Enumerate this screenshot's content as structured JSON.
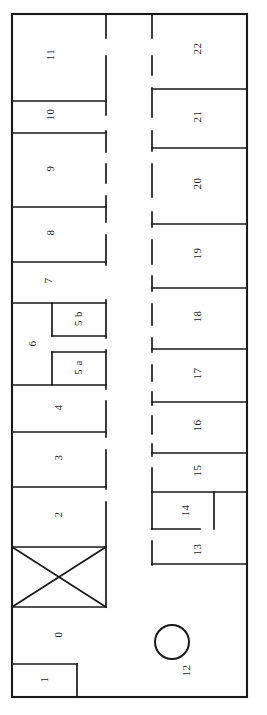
{
  "diagram": {
    "type": "floor-plan",
    "orientation": "rotated-90",
    "stroke_color": "#1a1a1a",
    "background_color": "#ffffff",
    "outline": {
      "x": 11,
      "y": 13,
      "width": 236,
      "height": 684
    },
    "rooms": [
      {
        "id": "room-0",
        "label": "0",
        "x": 12,
        "y": 607,
        "width": 94,
        "height": 57,
        "label_cx": 58,
        "label_cy": 636
      },
      {
        "id": "room-1",
        "label": "1",
        "x": 12,
        "y": 664,
        "width": 65,
        "height": 32,
        "label_cx": 44,
        "label_cy": 681
      },
      {
        "id": "room-2",
        "label": "2",
        "x": 12,
        "y": 487,
        "width": 94,
        "height": 60,
        "label_cx": 58,
        "label_cy": 516
      },
      {
        "id": "room-3",
        "label": "3",
        "x": 12,
        "y": 432,
        "width": 94,
        "height": 55,
        "label_cx": 58,
        "label_cy": 459
      },
      {
        "id": "room-4",
        "label": "4",
        "x": 12,
        "y": 385,
        "width": 94,
        "height": 47,
        "label_cx": 58,
        "label_cy": 409
      },
      {
        "id": "room-5a",
        "label": "5 a",
        "x": 52,
        "y": 352,
        "width": 54,
        "height": 33,
        "label_cx": 78,
        "label_cy": 369
      },
      {
        "id": "room-5b",
        "label": "5 b",
        "x": 52,
        "y": 303,
        "width": 54,
        "height": 33,
        "label_cx": 78,
        "label_cy": 320
      },
      {
        "id": "room-6",
        "label": "6",
        "x": 12,
        "y": 303,
        "width": 94,
        "height": 82,
        "label_cx": 32,
        "label_cy": 345
      },
      {
        "id": "room-7",
        "label": "7",
        "x": 12,
        "y": 262,
        "width": 94,
        "height": 41,
        "label_cx": 48,
        "label_cy": 282
      },
      {
        "id": "room-8",
        "label": "8",
        "x": 12,
        "y": 207,
        "width": 94,
        "height": 55,
        "label_cx": 50,
        "label_cy": 234
      },
      {
        "id": "room-9",
        "label": "9",
        "x": 12,
        "y": 133,
        "width": 94,
        "height": 74,
        "label_cx": 50,
        "label_cy": 170
      },
      {
        "id": "room-10",
        "label": "10",
        "x": 12,
        "y": 101,
        "width": 94,
        "height": 32,
        "label_cx": 50,
        "label_cy": 116
      },
      {
        "id": "room-11",
        "label": "11",
        "x": 12,
        "y": 13,
        "width": 94,
        "height": 88,
        "label_cx": 50,
        "label_cy": 56
      },
      {
        "id": "room-12",
        "label": "12",
        "x": 106,
        "y": 564,
        "width": 141,
        "height": 133,
        "label_cx": 186,
        "label_cy": 672
      },
      {
        "id": "room-13",
        "label": "13",
        "x": 152,
        "y": 529,
        "width": 95,
        "height": 35,
        "label_cx": 197,
        "label_cy": 551
      },
      {
        "id": "room-14",
        "label": "14",
        "x": 152,
        "y": 492,
        "width": 62,
        "height": 37,
        "label_cx": 185,
        "label_cy": 512
      },
      {
        "id": "room-15",
        "label": "15",
        "x": 152,
        "y": 453,
        "width": 95,
        "height": 39,
        "label_cx": 197,
        "label_cy": 472
      },
      {
        "id": "room-16",
        "label": "16",
        "x": 152,
        "y": 402,
        "width": 95,
        "height": 51,
        "label_cx": 197,
        "label_cy": 427
      },
      {
        "id": "room-17",
        "label": "17",
        "x": 152,
        "y": 349,
        "width": 95,
        "height": 53,
        "label_cx": 197,
        "label_cy": 375
      },
      {
        "id": "room-18",
        "label": "18",
        "x": 152,
        "y": 288,
        "width": 95,
        "height": 61,
        "label_cx": 197,
        "label_cy": 318
      },
      {
        "id": "room-19",
        "label": "19",
        "x": 152,
        "y": 224,
        "width": 95,
        "height": 64,
        "label_cx": 197,
        "label_cy": 255
      },
      {
        "id": "room-20",
        "label": "20",
        "x": 152,
        "y": 148,
        "width": 95,
        "height": 76,
        "label_cx": 197,
        "label_cy": 185
      },
      {
        "id": "room-21",
        "label": "21",
        "x": 152,
        "y": 89,
        "width": 95,
        "height": 59,
        "label_cx": 197,
        "label_cy": 118
      },
      {
        "id": "room-22",
        "label": "22",
        "x": 152,
        "y": 13,
        "width": 95,
        "height": 76,
        "label_cx": 197,
        "label_cy": 50
      }
    ],
    "features": [
      {
        "id": "stair-shaft",
        "name": "crossed-box-stairwell",
        "x": 12,
        "y": 547,
        "width": 94,
        "height": 60
      },
      {
        "id": "column-circle",
        "name": "circle-column",
        "cx": 172,
        "cy": 642,
        "r": 17
      }
    ]
  }
}
